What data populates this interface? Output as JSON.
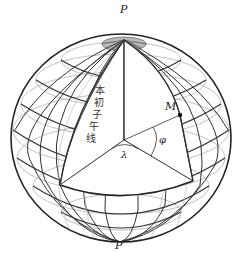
{
  "diagram": {
    "type": "globe-coordinates",
    "labels": {
      "north_pole": "P",
      "south_pole": "P′",
      "point": "M",
      "longitude": "λ",
      "latitude": "φ",
      "prime_meridian": [
        "本",
        "初",
        "子",
        "午",
        "线"
      ]
    },
    "colors": {
      "grid": "#3a3a3a",
      "grid_light": "#9a9a9a",
      "outline": "#222222",
      "background": "#ffffff"
    }
  }
}
